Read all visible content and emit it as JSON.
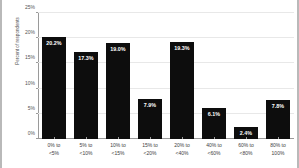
{
  "chart_data": {
    "type": "bar",
    "title": "",
    "xlabel": "",
    "ylabel": "Percent of respondents",
    "categories": [
      "0% to <5%",
      "5% to <10%",
      "10% to <15%",
      "15% to <20%",
      "20% to <40%",
      "40% to <60%",
      "60% to <80%",
      "80% to 100%"
    ],
    "category_lines": [
      [
        "0% to",
        "<5%"
      ],
      [
        "5% to",
        "<10%"
      ],
      [
        "10% to",
        "<15%"
      ],
      [
        "15% to",
        "<20%"
      ],
      [
        "20% to",
        "<40%"
      ],
      [
        "40% to",
        "<60%"
      ],
      [
        "60% to",
        "<80%"
      ],
      [
        "80% to",
        "100%"
      ]
    ],
    "values": [
      20.2,
      17.3,
      19.0,
      7.9,
      19.3,
      6.1,
      2.4,
      7.8
    ],
    "data_labels": [
      "20.2%",
      "17.3%",
      "19.0%",
      "7.9%",
      "19.3%",
      "6.1%",
      "2.4%",
      "7.8%"
    ],
    "ylim": [
      0,
      25
    ],
    "yticks": [
      0,
      5,
      10,
      15,
      20,
      25
    ],
    "ytick_labels": [
      "0%",
      "5%",
      "10%",
      "15%",
      "20%",
      "25%"
    ],
    "grid": true,
    "legend": false,
    "bar_color": "#0d0d0d",
    "label_color": "#ffffff",
    "grid_color": "#e8e8e8",
    "axis_color": "#9a9a9a",
    "background": "#ffffff"
  }
}
